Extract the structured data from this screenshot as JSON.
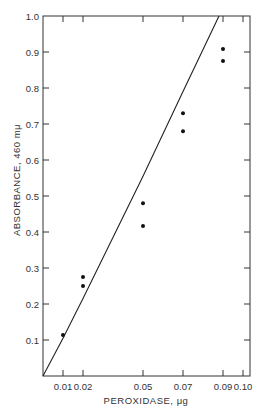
{
  "chart_data": {
    "type": "scatter",
    "title": "",
    "xlabel": "PEROXIDASE, μg",
    "ylabel": "ABSORBANCE, 460 mμ",
    "xlim": [
      0,
      0.1035
    ],
    "ylim": [
      0,
      1.0
    ],
    "grid": false,
    "legend": null,
    "x_ticks": [
      0.01,
      0.02,
      0.05,
      0.07,
      0.09,
      0.1
    ],
    "x_tick_labels": [
      "0.01",
      "0.02",
      "0.05",
      "0.07",
      "0.09",
      "0.10"
    ],
    "y_ticks": [
      0.1,
      0.2,
      0.3,
      0.4,
      0.5,
      0.6,
      0.7,
      0.8,
      0.9,
      1.0
    ],
    "y_tick_labels": [
      "0.1",
      "0.2",
      "0.3",
      "0.4",
      "0.5",
      "0.6",
      "0.7",
      "0.8",
      "0.9",
      "1.0"
    ],
    "series": [
      {
        "name": "measurements",
        "type": "scatter",
        "points": [
          {
            "x": 0.01,
            "y": 0.114
          },
          {
            "x": 0.02,
            "y": 0.275
          },
          {
            "x": 0.02,
            "y": 0.25
          },
          {
            "x": 0.05,
            "y": 0.48
          },
          {
            "x": 0.05,
            "y": 0.417
          },
          {
            "x": 0.07,
            "y": 0.73
          },
          {
            "x": 0.07,
            "y": 0.68
          },
          {
            "x": 0.09,
            "y": 0.908
          },
          {
            "x": 0.09,
            "y": 0.875
          }
        ]
      },
      {
        "name": "fit line",
        "type": "line",
        "points": [
          {
            "x": 0.0,
            "y": 0.0
          },
          {
            "x": 0.01,
            "y": 0.105
          },
          {
            "x": 0.02,
            "y": 0.215
          },
          {
            "x": 0.05,
            "y": 0.555
          },
          {
            "x": 0.07,
            "y": 0.79
          },
          {
            "x": 0.088,
            "y": 1.0
          }
        ]
      }
    ]
  }
}
